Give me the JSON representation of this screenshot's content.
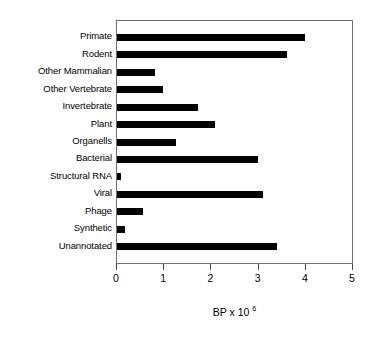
{
  "chart_data": {
    "type": "bar",
    "orientation": "horizontal",
    "title": "",
    "subtitle": "",
    "xlabel": "BP x 10",
    "xlabel_exponent": "6",
    "xlabel_full": "BP x 10^6",
    "ylabel": "",
    "categories": [
      "Primate",
      "Rodent",
      "Other Mammalian",
      "Other Vertebrate",
      "Invertebrate",
      "Plant",
      "Organells",
      "Bacterial",
      "Structural RNA",
      "Viral",
      "Phage",
      "Synthetic",
      "Unannotated"
    ],
    "values": [
      3.99,
      3.61,
      0.8,
      0.97,
      1.71,
      2.07,
      1.25,
      2.98,
      0.09,
      3.1,
      0.55,
      0.17,
      3.4
    ],
    "xlim": [
      0,
      5
    ],
    "xticks": [
      0,
      1,
      2,
      3,
      4,
      5
    ],
    "xtick_labels": [
      "0",
      "1",
      "2",
      "3",
      "4",
      "5"
    ],
    "grid": false,
    "legend": null,
    "bar_color": "#000000",
    "frame_color": "#6e6e6e",
    "background_color": "#ffffff"
  }
}
